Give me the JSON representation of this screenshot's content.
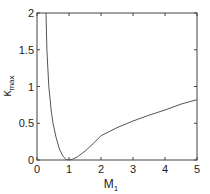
{
  "chart_data": {
    "type": "line",
    "title": "",
    "xlabel": "M",
    "xlabel_sub": "1",
    "ylabel": "κ",
    "ylabel_sub": "max",
    "xlim": [
      0,
      5
    ],
    "ylim": [
      0,
      2
    ],
    "xticks": [
      "0",
      "1",
      "2",
      "3",
      "4",
      "5"
    ],
    "yticks": [
      "0",
      "0.5",
      "1",
      "1.5",
      "2"
    ],
    "grid": false,
    "legend": null,
    "series": [
      {
        "name": "kappa_max",
        "color": "#555555",
        "x": [
          0.28,
          0.31,
          0.37,
          0.45,
          0.5,
          0.6,
          0.7,
          0.8,
          0.9,
          1.0,
          1.1,
          1.25,
          1.5,
          1.75,
          2.0,
          2.5,
          3.0,
          3.5,
          4.0,
          4.5,
          5.0
        ],
        "y": [
          2.0,
          1.5,
          1.0,
          0.65,
          0.5,
          0.3,
          0.15,
          0.06,
          0.01,
          0.0,
          0.01,
          0.04,
          0.12,
          0.22,
          0.33,
          0.44,
          0.53,
          0.61,
          0.68,
          0.76,
          0.82
        ]
      }
    ]
  }
}
